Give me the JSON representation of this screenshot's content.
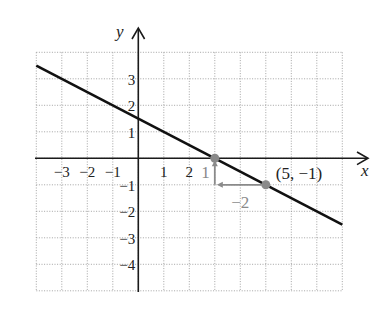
{
  "chart_data": {
    "type": "line",
    "title": "",
    "xlabel": "x",
    "ylabel": "y",
    "xlim": [
      -4,
      8
    ],
    "ylim": [
      -5,
      4
    ],
    "grid": true,
    "x_tick_labels": [
      "−3",
      "−2",
      "−1",
      "1",
      "2"
    ],
    "x_tick_values": [
      -3,
      -2,
      -1,
      1,
      2
    ],
    "y_tick_labels": [
      "3",
      "2",
      "1",
      "−1",
      "−2",
      "−3",
      "−4"
    ],
    "y_tick_values": [
      3,
      2,
      1,
      -1,
      -2,
      -3,
      -4
    ],
    "series": [
      {
        "name": "line",
        "equation": "y = -x/2 + 3/2",
        "x": [
          -4,
          8
        ],
        "y": [
          3.5,
          -2.5
        ],
        "color": "#111111"
      }
    ],
    "points": [
      {
        "x": 3,
        "y": 0,
        "label": "",
        "color": "#8a8a8a"
      },
      {
        "x": 5,
        "y": -1,
        "label": "(5, −1)",
        "color": "#8a8a8a"
      }
    ],
    "slope_triangle": {
      "rise": {
        "from": [
          3,
          -1
        ],
        "to": [
          3,
          0
        ],
        "label": "1"
      },
      "run": {
        "from": [
          5,
          -1
        ],
        "to": [
          3,
          -1
        ],
        "label": "−2"
      },
      "color": "#8a8a8a"
    }
  }
}
